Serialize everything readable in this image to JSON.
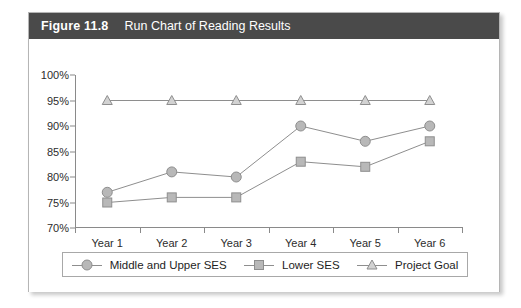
{
  "figure": {
    "number": "Figure 11.8",
    "title": "Run Chart of Reading Results"
  },
  "colors": {
    "header_background": "#4a4a4a",
    "header_text": "#ffffff",
    "marker_fill": "#b8b8b8",
    "marker_stroke": "#8e8e8e",
    "line": "#8e8e8e",
    "axis": "#8a8a8a",
    "frame": "#b5b5b5"
  },
  "legend": {
    "position": "bottom",
    "entries": [
      {
        "label": "Middle and Upper SES",
        "marker": "circle-marker-icon"
      },
      {
        "label": "Lower SES",
        "marker": "square-marker-icon"
      },
      {
        "label": "Project Goal",
        "marker": "triangle-marker-icon"
      }
    ]
  },
  "chart_data": {
    "type": "line",
    "title": "Run Chart of Reading Results",
    "xlabel": "",
    "ylabel": "",
    "categories": [
      "Year 1",
      "Year 2",
      "Year 3",
      "Year 4",
      "Year 5",
      "Year 6"
    ],
    "ylim": [
      70,
      100
    ],
    "ytick_values": [
      100,
      95,
      90,
      85,
      80,
      75,
      70
    ],
    "ytick_labels": [
      "100%",
      "95%",
      "90%",
      "85%",
      "80%",
      "75%",
      "70%"
    ],
    "grid": false,
    "legend_position": "bottom",
    "series": [
      {
        "name": "Middle and Upper SES",
        "marker": "circle",
        "values": [
          77,
          81,
          80,
          90,
          87,
          90
        ]
      },
      {
        "name": "Lower SES",
        "marker": "square",
        "values": [
          75,
          76,
          76,
          83,
          82,
          87
        ]
      },
      {
        "name": "Project Goal",
        "marker": "triangle",
        "values": [
          95,
          95,
          95,
          95,
          95,
          95
        ]
      }
    ]
  }
}
